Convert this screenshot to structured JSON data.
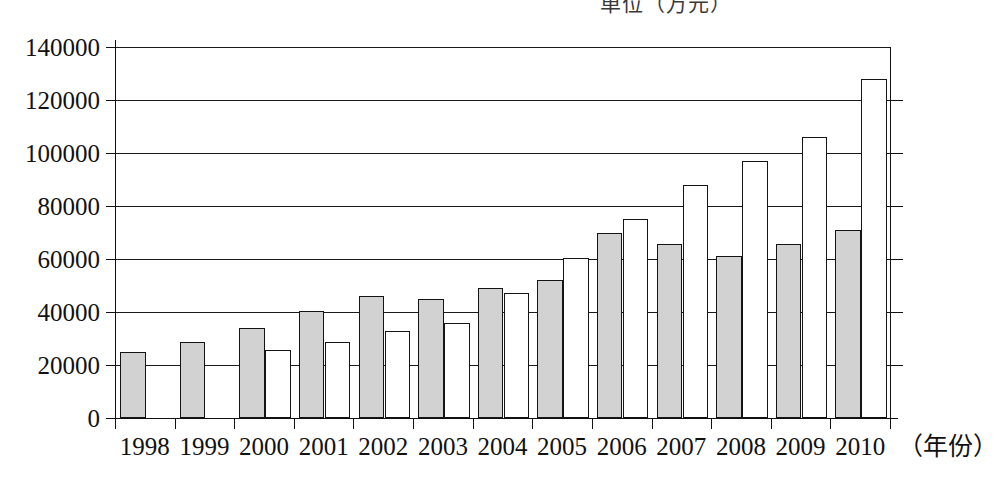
{
  "chart_data": {
    "type": "bar",
    "title": "",
    "unit_caption": "单位（万元）",
    "xlabel": "（年份）",
    "ylabel": "",
    "ylim": [
      0,
      140000
    ],
    "ytick_step": 20000,
    "ytick_labels": [
      "0",
      "20000",
      "40000",
      "60000",
      "80000",
      "100000",
      "120000",
      "140000"
    ],
    "ytick_values": [
      0,
      20000,
      40000,
      60000,
      80000,
      100000,
      120000,
      140000
    ],
    "grid": true,
    "legend_position": "none",
    "categories": [
      "1998",
      "1999",
      "2000",
      "2001",
      "2002",
      "2003",
      "2004",
      "2005",
      "2006",
      "2007",
      "2008",
      "2009",
      "2010"
    ],
    "series": [
      {
        "name": "系列1",
        "color": "#d2d2d2",
        "values": [
          25000,
          28500,
          34000,
          40500,
          46000,
          45000,
          49000,
          52000,
          70000,
          65500,
          61000,
          65500,
          71000
        ]
      },
      {
        "name": "系列2",
        "color": "#ffffff",
        "values": [
          null,
          null,
          25500,
          28500,
          33000,
          36000,
          47000,
          60500,
          75000,
          88000,
          97000,
          106000,
          128000
        ]
      }
    ]
  },
  "axis": {
    "x_title": "（年份）"
  }
}
